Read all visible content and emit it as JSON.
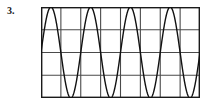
{
  "question": {
    "number_label": "3."
  },
  "figure": {
    "name": "oscilloscope-waveform-grid",
    "grid": {
      "columns": 8,
      "rows": 4,
      "border_color": "#1a1a1a",
      "gridline_color": "#4a4a4a",
      "background_color": "#ffffff",
      "border_width": 1.4,
      "gridline_width": 1.1,
      "x": 41,
      "y": 7,
      "width": 159,
      "height": 91
    },
    "trace": {
      "color": "#111111",
      "width": 1.4,
      "shape": "sine"
    }
  },
  "chart_data": {
    "type": "line",
    "title": "",
    "subtitle": "",
    "xlabel": "",
    "ylabel": "",
    "grid": true,
    "legend": null,
    "axis_ticks_visible": false,
    "xlim": [
      0,
      8
    ],
    "ylim": [
      -2,
      2
    ],
    "x_divisions": 8,
    "y_divisions": 4,
    "series": [
      {
        "name": "sine wave",
        "waveform": "sine",
        "cycles": 4,
        "amplitude_divisions": 2,
        "period_divisions": 2,
        "phase_degrees": 0,
        "vertical_center_division": 2,
        "description": "Four complete sine cycles spanning the 8 horizontal divisions, peak-to-peak filling all 4 vertical divisions."
      }
    ],
    "annotations": []
  }
}
